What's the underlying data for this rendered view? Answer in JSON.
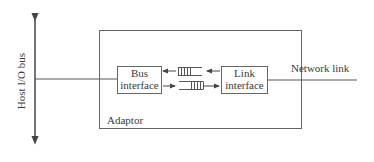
{
  "diagram": {
    "host_bus_label": "Host I/O bus",
    "adaptor_label": "Adaptor",
    "bus_interface": {
      "line1": "Bus",
      "line2": "interface"
    },
    "link_interface": {
      "line1": "Link",
      "line2": "interface"
    },
    "network_link_label": "Network link",
    "colors": {
      "line": "#555555",
      "text": "#3a3a3a",
      "background": "#ffffff"
    }
  }
}
